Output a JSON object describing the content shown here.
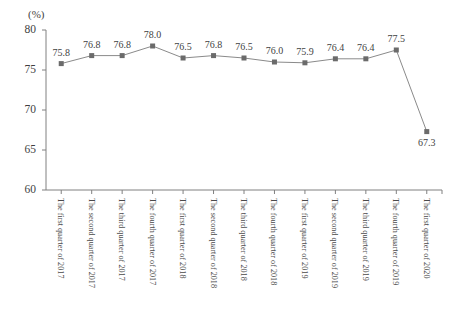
{
  "chart_data": {
    "type": "line",
    "title": "",
    "subtitle": "",
    "unit_label": "(%)",
    "xlabel": "",
    "ylabel": "",
    "ylim": [
      60,
      80
    ],
    "yticks": [
      60,
      65,
      70,
      75,
      80
    ],
    "grid": false,
    "legend": "none",
    "marker": "square",
    "series_color": "#6b6b6b",
    "line_color": "#8a8a8a",
    "axis_color": "#808080",
    "categories": [
      "The first quarter of 2017",
      "The second quarter of 2017",
      "The third quarter of 2017",
      "The fourth quarter of 2017",
      "The first quarter of 2018",
      "The second quarter of 2018",
      "The third quarter of 2018",
      "The fourth quarter of 2018",
      "The first quarter of 2019",
      "The second quarter of 2019",
      "The third quarter of 2019",
      "The fourth quarter of 2019",
      "The first quarter of 2020"
    ],
    "values": [
      75.8,
      76.8,
      76.8,
      78.0,
      76.5,
      76.8,
      76.5,
      76.0,
      75.9,
      76.4,
      76.4,
      77.5,
      67.3
    ],
    "data_labels": [
      "75.8",
      "76.8",
      "76.8",
      "78.0",
      "76.5",
      "76.8",
      "76.5",
      "76.0",
      "75.9",
      "76.4",
      "76.4",
      "77.5",
      "67.3"
    ],
    "ytick_labels": [
      "60",
      "65",
      "70",
      "75",
      "80"
    ]
  }
}
